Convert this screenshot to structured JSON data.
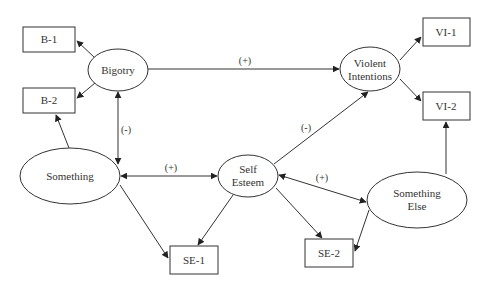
{
  "diagram": {
    "type": "structural-equation-model",
    "nodes": {
      "bigotry": {
        "label": "Bigotry",
        "shape": "ellipse"
      },
      "violent_intentions": {
        "label_line1": "Violent",
        "label_line2": "Intentions",
        "shape": "ellipse"
      },
      "something": {
        "label": "Something",
        "shape": "ellipse"
      },
      "self_esteem": {
        "label_line1": "Self",
        "label_line2": "Esteem",
        "shape": "ellipse"
      },
      "something_else": {
        "label_line1": "Something",
        "label_line2": "Else",
        "shape": "ellipse"
      },
      "b1": {
        "label": "B-1",
        "shape": "rect"
      },
      "b2": {
        "label": "B-2",
        "shape": "rect"
      },
      "vi1": {
        "label": "VI-1",
        "shape": "rect"
      },
      "vi2": {
        "label": "VI-2",
        "shape": "rect"
      },
      "se1": {
        "label": "SE-1",
        "shape": "rect"
      },
      "se2": {
        "label": "SE-2",
        "shape": "rect"
      }
    },
    "edges": [
      {
        "from": "Bigotry",
        "to": "B-1",
        "direction": "one-way"
      },
      {
        "from": "Bigotry",
        "to": "B-2",
        "direction": "one-way"
      },
      {
        "from": "Something",
        "to": "B-2",
        "direction": "one-way"
      },
      {
        "from": "Bigotry",
        "to": "Violent Intentions",
        "direction": "one-way",
        "label": "(+)"
      },
      {
        "from": "Bigotry",
        "to": "Something",
        "direction": "two-way",
        "label": "(-)"
      },
      {
        "from": "Violent Intentions",
        "to": "VI-1",
        "direction": "one-way"
      },
      {
        "from": "Violent Intentions",
        "to": "VI-2",
        "direction": "one-way"
      },
      {
        "from": "Something Else",
        "to": "VI-2",
        "direction": "one-way"
      },
      {
        "from": "Self Esteem",
        "to": "Violent Intentions",
        "direction": "one-way",
        "label": "(-)"
      },
      {
        "from": "Something",
        "to": "Self Esteem",
        "direction": "two-way",
        "label": "(+)"
      },
      {
        "from": "Self Esteem",
        "to": "Something Else",
        "direction": "two-way",
        "label": "(+)"
      },
      {
        "from": "Something",
        "to": "SE-1",
        "direction": "one-way"
      },
      {
        "from": "Self Esteem",
        "to": "SE-1",
        "direction": "one-way"
      },
      {
        "from": "Self Esteem",
        "to": "SE-2",
        "direction": "one-way"
      },
      {
        "from": "Something Else",
        "to": "SE-2",
        "direction": "one-way"
      }
    ],
    "edge_labels": {
      "bigotry_vi": "(+)",
      "bigotry_something": "(-)",
      "selfesteem_vi": "(-)",
      "something_selfesteem": "(+)",
      "selfesteem_somethingelse": "(+)"
    }
  }
}
